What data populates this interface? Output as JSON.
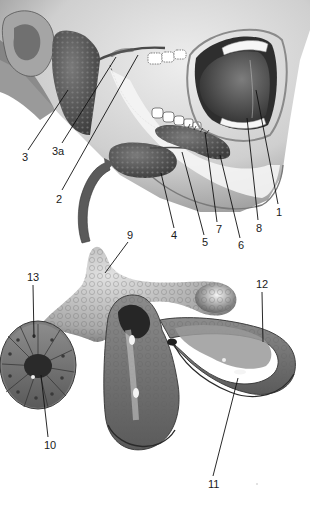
{
  "figure": {
    "colors": {
      "background": "#ffffff",
      "skin_light": "#e6e6e6",
      "skin_mid": "#b9b9b9",
      "skin_dark": "#6e6e6e",
      "gland": "#5a5a5a",
      "gland_dark": "#3a3a3a",
      "tongue": "#4a4a4a",
      "teeth": "#f4f4f4",
      "acinus_light": "#c8c8c8",
      "acinus_mid": "#8a8a8a",
      "acinus_dark": "#505050",
      "lumen": "#2a2a2a",
      "label_text": "#1a1a1a",
      "leader_line": "#111111"
    },
    "labels": [
      {
        "id": "1",
        "text": "1",
        "x": 276,
        "y": 216,
        "line": [
          278,
          204,
          256,
          90
        ]
      },
      {
        "id": "2",
        "text": "2",
        "x": 56,
        "y": 203,
        "line": [
          62,
          190,
          138,
          55
        ]
      },
      {
        "id": "3",
        "text": "3",
        "x": 22,
        "y": 161,
        "line": [
          28,
          150,
          68,
          90
        ]
      },
      {
        "id": "3a",
        "text": "3a",
        "x": 52,
        "y": 155,
        "line": [
          62,
          143,
          116,
          57
        ]
      },
      {
        "id": "4",
        "text": "4",
        "x": 171,
        "y": 239,
        "line": [
          174,
          228,
          161,
          173
        ]
      },
      {
        "id": "5",
        "text": "5",
        "x": 202,
        "y": 246,
        "line": [
          204,
          235,
          182,
          152
        ]
      },
      {
        "id": "6",
        "text": "6",
        "x": 238,
        "y": 249,
        "line": [
          240,
          238,
          220,
          155
        ]
      },
      {
        "id": "7",
        "text": "7",
        "x": 216,
        "y": 233,
        "line": [
          217,
          222,
          205,
          132
        ]
      },
      {
        "id": "8",
        "text": "8",
        "x": 256,
        "y": 232,
        "line": [
          258,
          220,
          247,
          118
        ]
      },
      {
        "id": "9",
        "text": "9",
        "x": 127,
        "y": 239,
        "line": [
          128,
          242,
          105,
          273
        ]
      },
      {
        "id": "10",
        "text": "10",
        "x": 44,
        "y": 449,
        "line": [
          48,
          437,
          41,
          375
        ]
      },
      {
        "id": "11",
        "text": "11",
        "x": 208,
        "y": 488,
        "line": [
          213,
          476,
          238,
          378
        ]
      },
      {
        "id": "12",
        "text": "12",
        "x": 256,
        "y": 288,
        "line": [
          262,
          292,
          263,
          342
        ]
      },
      {
        "id": "13",
        "text": "13",
        "x": 27,
        "y": 281,
        "line": [
          33,
          285,
          34,
          338
        ]
      }
    ]
  }
}
